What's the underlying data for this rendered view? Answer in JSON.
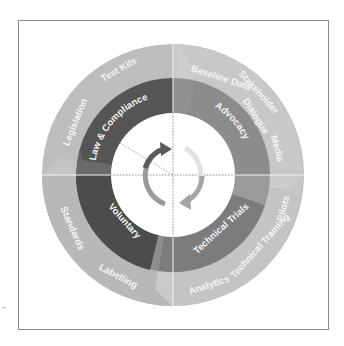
{
  "diagram": {
    "type": "concentric-ring-cycle",
    "center_icon": "cycle-arrows-icon",
    "colors": {
      "outer_ring": "#b9b9b9",
      "outer_ring_light": "#c9c9c9",
      "law_compliance": "#545454",
      "advocacy": "#8c8c8c",
      "technical_trials": "#7c7c7c",
      "voluntary": "#4c4c4c",
      "transition": "#9a9a9a",
      "arrow_dark": "#5a5a5a",
      "arrow_mid": "#9a9a9a",
      "arrow_light": "#dcdcdc",
      "center": "#ffffff"
    },
    "middle_ring": [
      {
        "label": "Law & Compliance"
      },
      {
        "label": "Advocacy"
      },
      {
        "label": "Technical Trials"
      },
      {
        "label": "Voluntary"
      }
    ],
    "outer_ring": [
      {
        "label": "Legislation"
      },
      {
        "label": "Test Kits"
      },
      {
        "label": "Baseline Data"
      },
      {
        "label": "Stakeholder"
      },
      {
        "label": "Dialogue"
      },
      {
        "label": "Media"
      },
      {
        "label": "Pilots"
      },
      {
        "label": "Technical Training"
      },
      {
        "label": "Analytics"
      },
      {
        "label": "Labelling"
      },
      {
        "label": "Standards"
      }
    ]
  }
}
